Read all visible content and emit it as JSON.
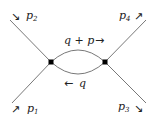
{
  "diagram": {
    "type": "one-loop bubble diagram",
    "external_legs": [
      {
        "id": "p1",
        "label": "p",
        "sub": "1",
        "arrow": "↗"
      },
      {
        "id": "p2",
        "label": "p",
        "sub": "2",
        "arrow": "↘"
      },
      {
        "id": "p3",
        "label": "p",
        "sub": "3",
        "arrow": "↘"
      },
      {
        "id": "p4",
        "label": "p",
        "sub": "4",
        "arrow": "↗"
      }
    ],
    "loop": {
      "upper_label": "q + p",
      "upper_arrow": "→",
      "lower_label": "q",
      "lower_arrow": "←"
    },
    "vertices": 2,
    "colors": {
      "line": "#555555",
      "vertex": "#000000",
      "text": "#222222"
    }
  }
}
